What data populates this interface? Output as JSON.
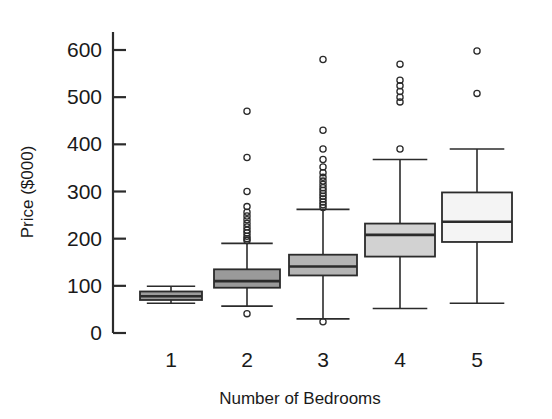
{
  "chart_data": {
    "type": "box",
    "title": "",
    "xlabel": "Number of Bedrooms",
    "ylabel": "Price ($000)",
    "categories": [
      "1",
      "2",
      "3",
      "4",
      "5"
    ],
    "yticks": [
      0,
      100,
      200,
      300,
      400,
      500,
      600
    ],
    "ytick_labels": [
      "0",
      "100",
      "200",
      "300",
      "400",
      "500",
      "600"
    ],
    "ylim": [
      0,
      640
    ],
    "grid": false,
    "legend": null,
    "boxes": [
      {
        "category": "1",
        "whisker_low": 63,
        "q1": 70,
        "median": 78,
        "q3": 88,
        "whisker_high": 99,
        "outliers": []
      },
      {
        "category": "2",
        "whisker_low": 57,
        "q1": 96,
        "median": 110,
        "q3": 135,
        "whisker_high": 190,
        "outliers": [
          41,
          196,
          200,
          205,
          212,
          218,
          225,
          232,
          240,
          248,
          256,
          268,
          300,
          372,
          470
        ]
      },
      {
        "category": "3",
        "whisker_low": 30,
        "q1": 122,
        "median": 141,
        "q3": 166,
        "whisker_high": 262,
        "outliers": [
          24,
          266,
          272,
          278,
          284,
          290,
          296,
          302,
          308,
          315,
          322,
          330,
          340,
          352,
          368,
          390,
          430,
          580
        ]
      },
      {
        "category": "4",
        "whisker_low": 52,
        "q1": 162,
        "median": 208,
        "q3": 232,
        "whisker_high": 368,
        "outliers": [
          390,
          490,
          500,
          512,
          524,
          536,
          570
        ]
      },
      {
        "category": "5",
        "whisker_low": 63,
        "q1": 193,
        "median": 236,
        "q3": 298,
        "whisker_high": 390,
        "outliers": [
          508,
          598
        ]
      }
    ],
    "box_fills": [
      "#9c9c9c",
      "#9a9a9a",
      "#b4b4b4",
      "#d2d2d2",
      "#f4f4f4"
    ],
    "axis_color": "#2b2b2b"
  }
}
